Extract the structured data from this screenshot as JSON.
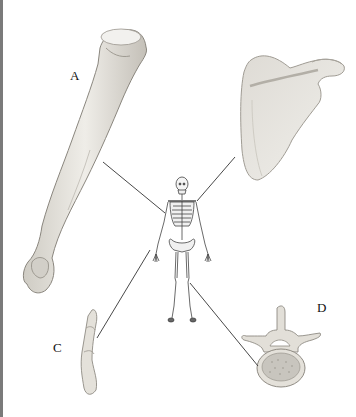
{
  "diagram": {
    "labels": [
      {
        "id": "A",
        "text": "A",
        "bone": "humerus"
      },
      {
        "id": "B",
        "text": "",
        "bone": "scapula"
      },
      {
        "id": "C",
        "text": "C",
        "bone": "phalanx (finger bones)"
      },
      {
        "id": "D",
        "text": "D",
        "bone": "vertebra"
      }
    ],
    "center_figure": "full human skeleton (anterior view)",
    "colors": {
      "bone": "#e6e3dc",
      "bone_shade": "#b9b5ac",
      "outline": "#6a6660",
      "leader_line": "#333333",
      "edge_bar": "#7a7a7a"
    }
  }
}
